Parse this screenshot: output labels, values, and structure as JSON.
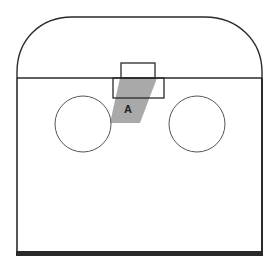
{
  "diagram": {
    "type": "floor-plan-schematic",
    "colors": {
      "background": "#ffffff",
      "stroke": "#2a2a2a",
      "circle_stroke": "#555555",
      "shaded_region": "#a9a9a9"
    },
    "labels": {
      "region_a": "A"
    },
    "elements": {
      "arch_top": {
        "description": "rounded arch top section"
      },
      "main_body": {
        "description": "rectangular main body with thick bottom edge"
      },
      "upper_box": {
        "description": "small rectangle above divider line"
      },
      "lower_box": {
        "description": "rectangle below divider line"
      },
      "left_circle": {
        "description": "left circle"
      },
      "right_circle": {
        "description": "right circle"
      },
      "shaded_region_a": {
        "description": "gray parallelogram labeled A"
      }
    }
  }
}
